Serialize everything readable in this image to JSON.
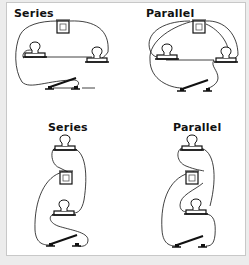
{
  "diagrams": [
    {
      "label": "Series",
      "layout": "horizontal"
    },
    {
      "label": "Parallel",
      "layout": "horizontal"
    },
    {
      "label": "Series",
      "layout": "vertical"
    },
    {
      "label": "Parallel",
      "layout": "vertical"
    }
  ],
  "colors": {
    "background": "#ececec",
    "card": "#ffffff",
    "line": "#111111",
    "border": "#c8c8c8"
  }
}
